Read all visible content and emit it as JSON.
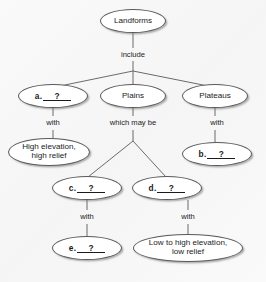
{
  "diagram": {
    "type": "concept-map",
    "background_color": "#f8f8f8",
    "node_fill": "#ffffff",
    "node_stroke": "#5a5a5a",
    "text_color": "#1b1b1b",
    "nodes": [
      {
        "id": "landforms",
        "label": "Landforms",
        "kind": "term",
        "x": 100,
        "y": 9,
        "w": 66,
        "h": 24
      },
      {
        "id": "a",
        "prefix": "a.",
        "answer": "?",
        "kind": "blank",
        "x": 18,
        "y": 84,
        "w": 70,
        "h": 24
      },
      {
        "id": "plains",
        "label": "Plains",
        "kind": "term",
        "x": 100,
        "y": 84,
        "w": 66,
        "h": 24
      },
      {
        "id": "plateaus",
        "label": "Plateaus",
        "kind": "term",
        "x": 182,
        "y": 84,
        "w": 66,
        "h": 24
      },
      {
        "id": "highrelief",
        "label": "High elevation,\nhigh relief",
        "kind": "term",
        "x": 8,
        "y": 138,
        "w": 82,
        "h": 28
      },
      {
        "id": "b",
        "prefix": "b.",
        "answer": "?",
        "kind": "blank",
        "x": 182,
        "y": 142,
        "w": 70,
        "h": 24
      },
      {
        "id": "c",
        "prefix": "c.",
        "answer": "?",
        "kind": "blank",
        "x": 52,
        "y": 176,
        "w": 70,
        "h": 24
      },
      {
        "id": "d",
        "prefix": "d.",
        "answer": "?",
        "kind": "blank",
        "x": 132,
        "y": 176,
        "w": 70,
        "h": 24
      },
      {
        "id": "e",
        "prefix": "e.",
        "answer": "?",
        "kind": "blank",
        "x": 52,
        "y": 236,
        "w": 70,
        "h": 24
      },
      {
        "id": "lowrelief",
        "label": "Low to high elevation,\nlow relief",
        "kind": "term",
        "x": 133,
        "y": 234,
        "w": 110,
        "h": 28
      }
    ],
    "edge_labels": [
      {
        "id": "include",
        "text": "include",
        "x": 100,
        "y": 50,
        "w": 66
      },
      {
        "id": "with-a",
        "text": "with",
        "x": 27,
        "y": 118,
        "w": 52
      },
      {
        "id": "whichmaybe",
        "text": "which may be",
        "x": 90,
        "y": 118,
        "w": 86
      },
      {
        "id": "with-plat",
        "text": "with",
        "x": 191,
        "y": 118,
        "w": 52
      },
      {
        "id": "with-c",
        "text": "with",
        "x": 61,
        "y": 212,
        "w": 52
      },
      {
        "id": "with-d",
        "text": "with",
        "x": 162,
        "y": 212,
        "w": 52
      }
    ],
    "connectors": [
      {
        "id": "landforms-to-include",
        "points": "133,33 133,48"
      },
      {
        "id": "include-to-fork",
        "points": "133,60 133,70"
      },
      {
        "id": "fork-to-a",
        "points": "133,70 53,84"
      },
      {
        "id": "fork-to-plains",
        "points": "133,70 133,84"
      },
      {
        "id": "fork-to-plateaus",
        "points": "133,70 215,84"
      },
      {
        "id": "a-to-with",
        "points": "53,108 53,117"
      },
      {
        "id": "with-to-highrelief",
        "points": "53,129 53,140"
      },
      {
        "id": "plains-to-whichmaybe",
        "points": "133,108 133,117"
      },
      {
        "id": "whichmaybe-to-fork",
        "points": "133,129 133,140"
      },
      {
        "id": "fork2-to-c",
        "points": "133,140 87,178"
      },
      {
        "id": "fork2-to-d",
        "points": "133,140 167,178"
      },
      {
        "id": "plateaus-to-with",
        "points": "215,108 215,117"
      },
      {
        "id": "with-to-b",
        "points": "215,129 215,142"
      },
      {
        "id": "c-to-with",
        "points": "87,200 87,211"
      },
      {
        "id": "with-to-e",
        "points": "87,223 87,236"
      },
      {
        "id": "d-to-with",
        "points": "188,200 188,211"
      },
      {
        "id": "with-to-lowrelief",
        "points": "188,223 188,234"
      }
    ]
  }
}
